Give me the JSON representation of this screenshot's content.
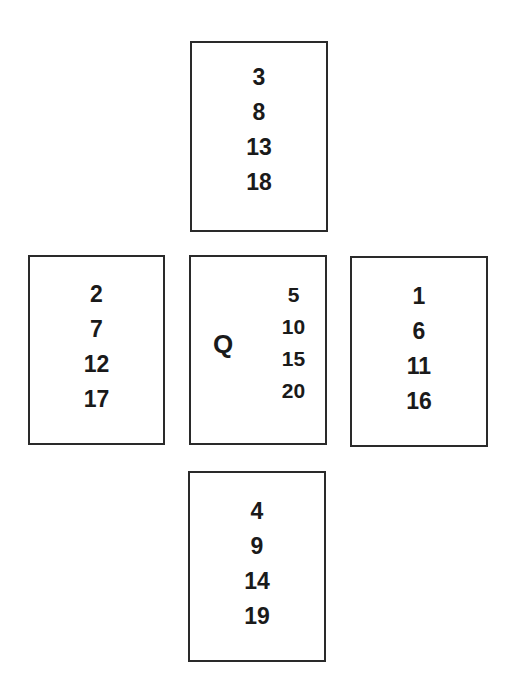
{
  "diagram": {
    "type": "card-layout",
    "cards": {
      "top": {
        "numbers": [
          "3",
          "8",
          "13",
          "18"
        ]
      },
      "left": {
        "numbers": [
          "2",
          "7",
          "12",
          "17"
        ]
      },
      "center": {
        "label": "Q",
        "numbers": [
          "5",
          "10",
          "15",
          "20"
        ]
      },
      "right": {
        "numbers": [
          "1",
          "6",
          "11",
          "16"
        ]
      },
      "bottom": {
        "numbers": [
          "4",
          "9",
          "14",
          "19"
        ]
      }
    }
  },
  "colors": {
    "border": "#2a2a2a",
    "text": "#1a1a1a",
    "background": "#ffffff"
  }
}
